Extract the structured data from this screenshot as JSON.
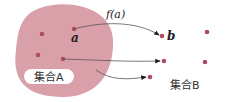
{
  "diagram": {
    "function_label": "f(a)",
    "element_a": "a",
    "element_b": "b",
    "set_a_label": "集合A",
    "set_b_label": "集合B",
    "colors": {
      "set_a_fill": "#d9a0aa",
      "point": "#b04a5e",
      "arrow": "#555555",
      "label_bg": "#ffffff"
    }
  }
}
